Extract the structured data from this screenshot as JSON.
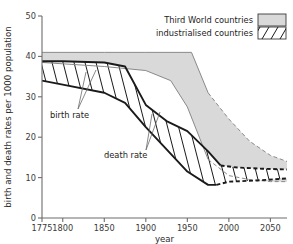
{
  "chart_data": {
    "type": "area",
    "title": "",
    "xlabel": "year",
    "ylabel": "birth and death rates per 1000 population",
    "xlim": [
      1775,
      2070
    ],
    "ylim": [
      0,
      50
    ],
    "xticks": [
      1775,
      1800,
      1850,
      1900,
      1950,
      2000,
      2050
    ],
    "xticklabels": [
      "1775",
      "1800",
      "1850",
      "1900",
      "1950",
      "2000",
      "2050"
    ],
    "yticks": [
      0,
      10,
      20,
      30,
      40,
      50
    ],
    "yticklabels": [
      "0",
      "10",
      "20",
      "30",
      "40",
      "50"
    ],
    "grid": false,
    "legend_position": "top-right",
    "legend": [
      {
        "label": "Third World countries",
        "swatch": "solid-gray",
        "color": "#d9d9d9"
      },
      {
        "label": "industrialised countries",
        "swatch": "diagonal-hatch",
        "color": "#ffffff"
      }
    ],
    "annotations": [
      {
        "text": "birth rate",
        "x": 1800,
        "y": 26
      },
      {
        "text": "death rate",
        "x": 1855,
        "y": 18
      }
    ],
    "series": [
      {
        "name": "Third World countries birth rate",
        "role": "band-top",
        "group": "Third World countries",
        "x": [
          1775,
          1850,
          1900,
          1955,
          1975,
          2000,
          2025,
          2050,
          2070
        ],
        "values": [
          41.0,
          41.0,
          41.0,
          41.0,
          31.0,
          24.5,
          19.0,
          15.5,
          14.0
        ],
        "dashed_from": 1975
      },
      {
        "name": "Third World countries death rate",
        "role": "band-bottom",
        "group": "Third World countries",
        "x": [
          1775,
          1850,
          1900,
          1930,
          1950,
          1975,
          2000,
          2025,
          2050,
          2070
        ],
        "values": [
          38.5,
          37.5,
          36.5,
          34.0,
          27.5,
          14.5,
          10.5,
          9.5,
          9.0,
          9.0
        ],
        "dashed_from": 1975
      },
      {
        "name": "industrialised countries birth rate",
        "role": "band-top",
        "group": "industrialised countries",
        "x": [
          1775,
          1800,
          1850,
          1875,
          1900,
          1925,
          1950,
          1975,
          1990,
          2010,
          2040,
          2070
        ],
        "values": [
          38.8,
          38.8,
          38.5,
          37.5,
          28.0,
          24.0,
          21.5,
          16.5,
          13.0,
          12.5,
          12.2,
          12.0
        ],
        "dashed_from": 1990
      },
      {
        "name": "industrialised countries death rate",
        "role": "band-bottom",
        "group": "industrialised countries",
        "x": [
          1775,
          1800,
          1850,
          1875,
          1900,
          1925,
          1950,
          1975,
          1985,
          2000,
          2035,
          2070
        ],
        "values": [
          34.0,
          33.0,
          31.0,
          28.5,
          22.5,
          17.0,
          11.5,
          8.2,
          8.2,
          9.0,
          9.3,
          9.8
        ],
        "dashed_from": 1985
      }
    ]
  },
  "axis": {
    "ylabel": "birth and death rates per 1000 population",
    "xlabel": "year"
  }
}
